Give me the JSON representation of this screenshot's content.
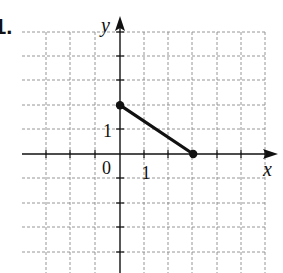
{
  "problem": {
    "number_label": "1."
  },
  "chart_data": {
    "type": "line",
    "title": "",
    "xlabel": "x",
    "ylabel": "y",
    "xlim": [
      -3,
      6
    ],
    "ylim": [
      -5,
      5
    ],
    "grid": true,
    "grid_style": "dashed",
    "tick_labels": {
      "origin": "0",
      "x": [
        {
          "value": 1,
          "label": "1"
        }
      ],
      "y": [
        {
          "value": 1,
          "label": "1"
        }
      ]
    },
    "series": [
      {
        "name": "segment",
        "points": [
          [
            0,
            2
          ],
          [
            3,
            0
          ]
        ],
        "endpoints": "closed-dots",
        "color": "#111111"
      }
    ]
  },
  "layout": {
    "origin_px": [
      120,
      154
    ],
    "unit_px": 24.4,
    "grid_x_px": [
      46,
      70,
      95,
      120,
      144,
      168,
      192,
      217,
      241,
      265
    ],
    "grid_y_px": [
      32,
      56,
      80,
      105,
      129,
      154,
      178,
      203,
      227,
      252
    ]
  },
  "colors": {
    "axis": "#111111",
    "grid": "#8a8a8a",
    "segment": "#111111",
    "background": "#ffffff"
  }
}
